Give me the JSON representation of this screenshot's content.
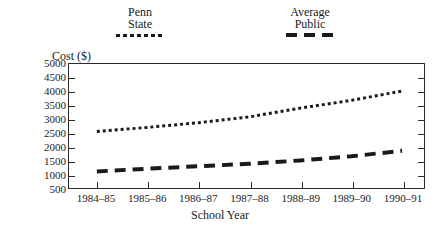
{
  "chart_data": {
    "type": "line",
    "title": "",
    "xlabel": "School Year",
    "ylabel": "Cost ($)",
    "categories": [
      "1984–85",
      "1985–86",
      "1986–87",
      "1987–88",
      "1988–89",
      "1989–90",
      "1990–91"
    ],
    "ylim": [
      500,
      5000
    ],
    "yticks": [
      500,
      1000,
      1500,
      2000,
      2500,
      3000,
      3500,
      4000,
      4500,
      5000
    ],
    "ytick_labels": [
      "500",
      "1000",
      "1500",
      "2000",
      "2500",
      "3000",
      "3500",
      "4000",
      "4500",
      "5000"
    ],
    "grid": false,
    "legend_position": "above-plot",
    "series": [
      {
        "name": "Penn State",
        "legend_label_lines": [
          "Penn",
          "State"
        ],
        "style": "dotted",
        "color": "#1a1a1a",
        "values": [
          2550,
          2700,
          2870,
          3080,
          3400,
          3680,
          4020
        ]
      },
      {
        "name": "Average Public",
        "legend_label_lines": [
          "Average",
          "Public"
        ],
        "style": "dashed",
        "color": "#1a1a1a",
        "values": [
          1100,
          1200,
          1290,
          1380,
          1500,
          1650,
          1850
        ]
      }
    ]
  }
}
